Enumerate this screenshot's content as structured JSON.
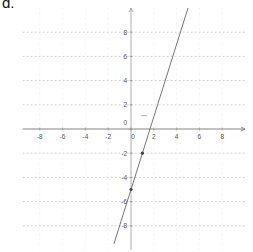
{
  "figure_label": "d.",
  "chart_data": {
    "type": "line",
    "title": "",
    "xlabel": "",
    "ylabel": "",
    "xlim": [
      -9.5,
      10
    ],
    "ylim": [
      -10,
      10
    ],
    "grid": true,
    "x_ticks": [
      -8,
      -6,
      -4,
      -2,
      0,
      2,
      4,
      6,
      8
    ],
    "y_ticks": [
      8,
      6,
      4,
      2,
      0,
      -2,
      -4,
      -6,
      -8
    ],
    "x_tick_labels": [
      "-8",
      "-6",
      "-4",
      "-2",
      "0",
      "2",
      "4",
      "6",
      "8"
    ],
    "y_tick_labels": [
      "8",
      "6",
      "4",
      "2",
      "0",
      "-2",
      "-4",
      "-6",
      "-8"
    ],
    "series": [
      {
        "name": "line",
        "equation": "y = 3x - 5",
        "slope": 3,
        "intercept": -5,
        "x": [
          -1.5,
          5
        ],
        "y": [
          -9.5,
          10
        ]
      }
    ],
    "points": [
      {
        "x": 0,
        "y": -5
      },
      {
        "x": 1,
        "y": -2
      }
    ],
    "color": "#666666"
  }
}
